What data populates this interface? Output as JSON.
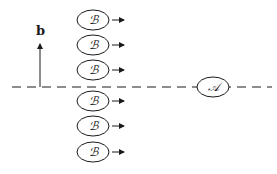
{
  "diagram": {
    "vector_label": "b",
    "reference_line_style": "dashed",
    "particle_a": {
      "label": "𝒜"
    },
    "particles_b": [
      {
        "label": "ℬ",
        "side": "above"
      },
      {
        "label": "ℬ",
        "side": "above"
      },
      {
        "label": "ℬ",
        "side": "above"
      },
      {
        "label": "ℬ",
        "side": "below"
      },
      {
        "label": "ℬ",
        "side": "below"
      },
      {
        "label": "ℬ",
        "side": "below"
      }
    ],
    "b_motion_direction": "right",
    "colors": {
      "ink": "#1a1a1a",
      "background": "#ffffff"
    }
  }
}
